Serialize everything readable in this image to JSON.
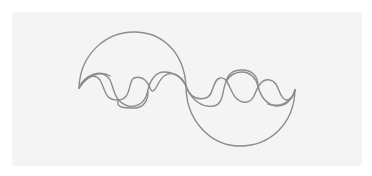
{
  "figure": {
    "stroke_color": "#8c8c8c",
    "panel_color": "#f4f4f4",
    "background_color": "#ffffff",
    "stroke_width": 1.4
  }
}
